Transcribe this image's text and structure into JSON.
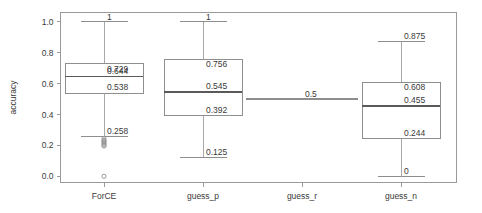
{
  "chart_data": {
    "type": "box",
    "title": "",
    "xlabel": "",
    "ylabel": "accuracy",
    "ylim": [
      -0.04,
      1.06
    ],
    "yticks": [
      0.0,
      0.2,
      0.4,
      0.6,
      0.8,
      1.0
    ],
    "ytick_labels": [
      "0.0",
      "0.2",
      "0.4",
      "0.6",
      "0.8",
      "1.0"
    ],
    "grid": false,
    "legend": "none",
    "categories": [
      "ForCE",
      "guess_p",
      "guess_r",
      "guess_n"
    ],
    "boxes": [
      {
        "name": "ForCE",
        "whisker_high": 1,
        "q3": 0.729,
        "median": 0.644,
        "q1": 0.538,
        "whisker_low": 0.258,
        "labels": {
          "whisker_high": "1",
          "q3": "0.729",
          "median": "0.644",
          "q1": "0.538",
          "whisker_low": "0.258"
        },
        "outliers": [
          0.243,
          0.232,
          0.224,
          0.215,
          0.205,
          0.196,
          0.0
        ],
        "has_box": true
      },
      {
        "name": "guess_p",
        "whisker_high": 1,
        "q3": 0.756,
        "median": 0.545,
        "q1": 0.392,
        "whisker_low": 0.125,
        "labels": {
          "whisker_high": "1",
          "q3": "0.756",
          "median": "0.545",
          "q1": "0.392",
          "whisker_low": "0.125"
        },
        "outliers": [],
        "has_box": true
      },
      {
        "name": "guess_r",
        "whisker_high": 0.5,
        "q3": 0.5,
        "median": 0.5,
        "q1": 0.5,
        "whisker_low": 0.5,
        "labels": {
          "median": "0.5"
        },
        "outliers": [],
        "has_box": false
      },
      {
        "name": "guess_n",
        "whisker_high": 0.875,
        "q3": 0.608,
        "median": 0.455,
        "q1": 0.244,
        "whisker_low": 0,
        "labels": {
          "whisker_high": "0.875",
          "q3": "0.608",
          "median": "0.455",
          "q1": "0.244",
          "whisker_low": "0"
        },
        "outliers": [],
        "has_box": true
      }
    ],
    "colors": {
      "frame": "#9a9a9a",
      "box_edge": "#8e8e8e",
      "median": "#5a5a5a",
      "whisker": "#a8a8a8",
      "text": "#3a3a3a",
      "background": "#ffffff"
    }
  }
}
